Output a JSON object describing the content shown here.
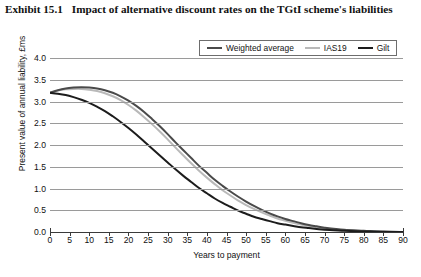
{
  "title": {
    "number": "Exhibit 15.1",
    "text": "Impact of alternative discount rates on the TGtI scheme's liabilities"
  },
  "colors": {
    "weighted_average": "#4a4a4a",
    "ias19": "#b9b9b9",
    "gilt": "#1c1c1c",
    "grid": "#9a9a9a",
    "axis": "#3a3a3a",
    "background": "#ffffff"
  },
  "chart_data": {
    "type": "line",
    "title": "Impact of alternative discount rates on the TGtI scheme's liabilities",
    "xlabel": "Years to payment",
    "ylabel": "Present value of annual liability, £ms",
    "xlim": [
      0,
      90
    ],
    "ylim": [
      0.0,
      4.0
    ],
    "xticks": [
      0,
      5,
      10,
      15,
      20,
      25,
      30,
      35,
      40,
      45,
      50,
      55,
      60,
      65,
      70,
      75,
      80,
      85,
      90
    ],
    "yticks": [
      0.0,
      0.5,
      1.0,
      1.5,
      2.0,
      2.5,
      3.0,
      3.5,
      4.0
    ],
    "ytick_labels": [
      "0.0",
      "0.5",
      "1.0",
      "1.5",
      "2.0",
      "2.5",
      "3.0",
      "3.5",
      "4.0"
    ],
    "xtick_labels": [
      "0",
      "5",
      "10",
      "15",
      "20",
      "25",
      "30",
      "35",
      "40",
      "45",
      "50",
      "55",
      "60",
      "65",
      "70",
      "75",
      "80",
      "85",
      "90"
    ],
    "grid": "horizontal",
    "legend_position": "top-right",
    "x": [
      0,
      2,
      4,
      6,
      8,
      10,
      12,
      14,
      16,
      18,
      20,
      22,
      24,
      26,
      28,
      30,
      32,
      34,
      36,
      38,
      40,
      42,
      44,
      46,
      48,
      50,
      52,
      54,
      56,
      58,
      60,
      62,
      64,
      66,
      68,
      70,
      75,
      80,
      85,
      90
    ],
    "series": [
      {
        "name": "Weighted average",
        "color": "#4a4a4a",
        "values": [
          3.2,
          3.26,
          3.3,
          3.32,
          3.33,
          3.32,
          3.3,
          3.26,
          3.2,
          3.12,
          3.02,
          2.9,
          2.76,
          2.6,
          2.43,
          2.25,
          2.06,
          1.88,
          1.7,
          1.52,
          1.36,
          1.2,
          1.06,
          0.93,
          0.81,
          0.7,
          0.6,
          0.51,
          0.43,
          0.36,
          0.3,
          0.25,
          0.2,
          0.16,
          0.13,
          0.1,
          0.05,
          0.03,
          0.01,
          0.0
        ]
      },
      {
        "name": "IAS19",
        "color": "#b9b9b9",
        "values": [
          3.2,
          3.25,
          3.28,
          3.29,
          3.29,
          3.27,
          3.24,
          3.19,
          3.12,
          3.03,
          2.92,
          2.79,
          2.64,
          2.48,
          2.31,
          2.13,
          1.94,
          1.76,
          1.58,
          1.41,
          1.25,
          1.1,
          0.96,
          0.84,
          0.72,
          0.62,
          0.53,
          0.45,
          0.38,
          0.31,
          0.26,
          0.21,
          0.17,
          0.14,
          0.11,
          0.08,
          0.04,
          0.02,
          0.01,
          0.0
        ]
      },
      {
        "name": "Gilt",
        "color": "#1c1c1c",
        "values": [
          3.2,
          3.18,
          3.15,
          3.1,
          3.04,
          2.97,
          2.88,
          2.78,
          2.66,
          2.53,
          2.39,
          2.24,
          2.08,
          1.92,
          1.76,
          1.6,
          1.44,
          1.29,
          1.15,
          1.01,
          0.89,
          0.77,
          0.67,
          0.58,
          0.49,
          0.42,
          0.35,
          0.3,
          0.25,
          0.2,
          0.17,
          0.14,
          0.11,
          0.09,
          0.07,
          0.05,
          0.03,
          0.01,
          0.0,
          0.0
        ]
      }
    ]
  }
}
